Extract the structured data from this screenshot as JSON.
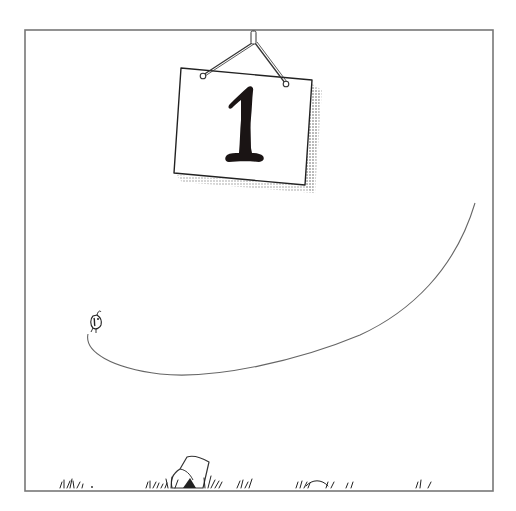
{
  "panel": {
    "frame": {
      "x": 25,
      "y": 30,
      "width": 468,
      "height": 461,
      "stroke": "#777777"
    },
    "background": "#ffffff"
  },
  "sign": {
    "number": "1",
    "corners": {
      "top_left": [
        181,
        68
      ],
      "top_right": [
        312,
        80
      ],
      "bottom_right": [
        305,
        185
      ],
      "bottom_left": [
        174,
        173
      ]
    },
    "fill": "#ffffff",
    "stroke": "#222222",
    "numeral_color": "#1a1414",
    "shadow_pattern": "dotted-halftone",
    "hanger": {
      "anchor": [
        253,
        31
      ],
      "left_hook": [
        202,
        76
      ],
      "right_hook": [
        286,
        84
      ]
    }
  },
  "creature": {
    "icon": "flea-icon",
    "position": [
      96,
      322
    ]
  },
  "motion_trail": {
    "start": [
      88,
      333
    ],
    "end": [
      475,
      203
    ],
    "stroke": "#666666"
  },
  "ground": {
    "grass_tufts": [
      {
        "x": 60,
        "y": 487
      },
      {
        "x": 148,
        "y": 487
      },
      {
        "x": 178,
        "y": 487
      },
      {
        "x": 215,
        "y": 487
      },
      {
        "x": 252,
        "y": 487
      },
      {
        "x": 300,
        "y": 487
      },
      {
        "x": 345,
        "y": 487
      },
      {
        "x": 420,
        "y": 487
      }
    ],
    "rock": {
      "x": 172,
      "y": 457
    }
  }
}
